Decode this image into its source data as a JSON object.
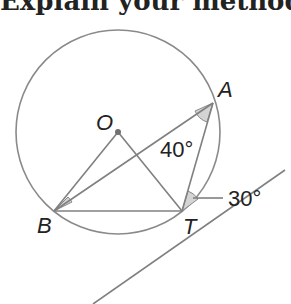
{
  "header": {
    "text": "Explain your method"
  },
  "diagram": {
    "points": {
      "O": {
        "label": "O",
        "x": 118,
        "y": 132
      },
      "A": {
        "label": "A",
        "x": 213,
        "y": 103
      },
      "B": {
        "label": "B",
        "x": 54,
        "y": 211
      },
      "T": {
        "label": "T",
        "x": 182,
        "y": 211
      }
    },
    "circle": {
      "cx": 118,
      "cy": 132,
      "r": 102
    },
    "angles": {
      "angle_BAT": "40°",
      "angle_ATtangent": "30°"
    },
    "colors": {
      "line": "#808080",
      "shade": "#d0d0d0",
      "text": "#222222"
    }
  }
}
